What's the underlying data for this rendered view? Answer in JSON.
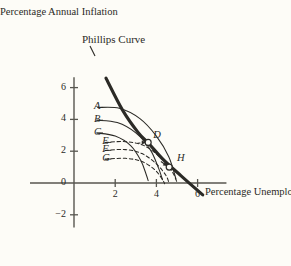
{
  "chart_data": {
    "type": "line",
    "title": "",
    "annotations": [
      {
        "name": "curve-title",
        "text": "Phillips Curve",
        "x": 82,
        "y": 33
      }
    ],
    "xlabel": "Percentage Unemployment",
    "ylabel": "Percentage Annual Inflation",
    "xlim": [
      0,
      7.4
    ],
    "ylim": [
      -3,
      7
    ],
    "grid": false,
    "legend": null,
    "xticks": [
      {
        "value": 2,
        "label": "2"
      },
      {
        "value": 4,
        "label": "4"
      },
      {
        "value": 6,
        "label": "6"
      }
    ],
    "yticks": [
      {
        "value": 6,
        "label": "6"
      },
      {
        "value": 4,
        "label": "4"
      },
      {
        "value": 2,
        "label": "2"
      },
      {
        "value": 0,
        "label": "0"
      },
      {
        "value": -2,
        "label": "−2"
      }
    ],
    "series": [
      {
        "name": "Phillips Curve",
        "style": "thick-solid",
        "points": [
          {
            "x": 1.55,
            "y": 6.6
          },
          {
            "x": 2.35,
            "y": 4.6
          },
          {
            "x": 3.1,
            "y": 3.2
          },
          {
            "x": 3.65,
            "y": 2.45
          },
          {
            "x": 4.35,
            "y": 1.45
          },
          {
            "x": 5.2,
            "y": 0.45
          },
          {
            "x": 6.25,
            "y": -0.75
          }
        ]
      },
      {
        "name": "Short-run curve A",
        "style": "solid",
        "label": "A",
        "points": [
          {
            "x": 1.15,
            "y": 4.75
          },
          {
            "x": 2.2,
            "y": 4.7
          },
          {
            "x": 3.2,
            "y": 4.05
          },
          {
            "x": 4.0,
            "y": 2.95
          },
          {
            "x": 4.6,
            "y": 1.65
          },
          {
            "x": 4.95,
            "y": 0.25
          }
        ]
      },
      {
        "name": "Short-run curve B",
        "style": "solid",
        "label": "B",
        "points": [
          {
            "x": 1.1,
            "y": 3.95
          },
          {
            "x": 2.1,
            "y": 3.8
          },
          {
            "x": 3.0,
            "y": 3.15
          },
          {
            "x": 3.7,
            "y": 2.1
          },
          {
            "x": 4.1,
            "y": 0.95
          },
          {
            "x": 4.3,
            "y": 0.2
          }
        ]
      },
      {
        "name": "Short-run curve C",
        "style": "solid",
        "label": "C",
        "points": [
          {
            "x": 1.1,
            "y": 3.15
          },
          {
            "x": 2.0,
            "y": 2.95
          },
          {
            "x": 2.75,
            "y": 2.35
          },
          {
            "x": 3.25,
            "y": 1.4
          },
          {
            "x": 3.5,
            "y": 0.55
          },
          {
            "x": 3.6,
            "y": 0.15
          }
        ]
      },
      {
        "name": "Expected curve E",
        "style": "dashed",
        "label": "E",
        "points": [
          {
            "x": 1.5,
            "y": 2.55
          },
          {
            "x": 2.5,
            "y": 2.6
          },
          {
            "x": 3.4,
            "y": 2.35
          },
          {
            "x": 4.2,
            "y": 1.6
          },
          {
            "x": 4.75,
            "y": 0.75
          },
          {
            "x": 5.0,
            "y": 0.05
          }
        ]
      },
      {
        "name": "Expected curve F",
        "style": "dashed",
        "label": "F",
        "points": [
          {
            "x": 1.5,
            "y": 2.05
          },
          {
            "x": 2.5,
            "y": 2.1
          },
          {
            "x": 3.3,
            "y": 1.85
          },
          {
            "x": 4.0,
            "y": 1.2
          },
          {
            "x": 4.45,
            "y": 0.5
          },
          {
            "x": 4.6,
            "y": 0.05
          }
        ]
      },
      {
        "name": "Expected curve G",
        "style": "dashed",
        "label": "G",
        "points": [
          {
            "x": 1.5,
            "y": 1.5
          },
          {
            "x": 2.5,
            "y": 1.55
          },
          {
            "x": 3.3,
            "y": 1.35
          },
          {
            "x": 3.95,
            "y": 0.8
          },
          {
            "x": 4.3,
            "y": 0.2
          },
          {
            "x": 4.4,
            "y": -0.05
          }
        ]
      }
    ],
    "marked_points": [
      {
        "label": "D",
        "x": 3.6,
        "y": 2.55,
        "marker": "open-circle"
      },
      {
        "label": "H",
        "x": 4.62,
        "y": 1.0,
        "marker": "open-circle"
      }
    ],
    "curve_labels": [
      {
        "label": "A",
        "x": 1.02,
        "y": 4.75
      },
      {
        "label": "B",
        "x": 1.02,
        "y": 3.95
      },
      {
        "label": "C",
        "x": 1.02,
        "y": 3.15
      },
      {
        "label": "E",
        "x": 1.42,
        "y": 2.55
      },
      {
        "label": "F",
        "x": 1.42,
        "y": 2.05
      },
      {
        "label": "G",
        "x": 1.42,
        "y": 1.5
      }
    ],
    "point_labels": [
      {
        "label": "D",
        "x": 3.85,
        "y": 2.95
      },
      {
        "label": "H",
        "x": 5.0,
        "y": 1.5
      }
    ],
    "colors": {
      "background": "#fdfcf7",
      "ink": "#2b2a26",
      "axis": "#57564f"
    }
  }
}
